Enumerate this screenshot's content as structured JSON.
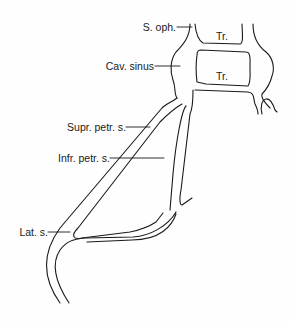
{
  "diagram": {
    "labels": {
      "s_oph": "S. oph.",
      "cav_sinus": "Cav. sinus",
      "tr_upper": "Tr.",
      "tr_lower": "Tr.",
      "supr_petr": "Supr. petr. s.",
      "infr_petr": "Infr. petr. s.",
      "lat_s": "Lat. s."
    },
    "colors": {
      "line": "#1a1a1a",
      "background": "#fefefe"
    }
  }
}
